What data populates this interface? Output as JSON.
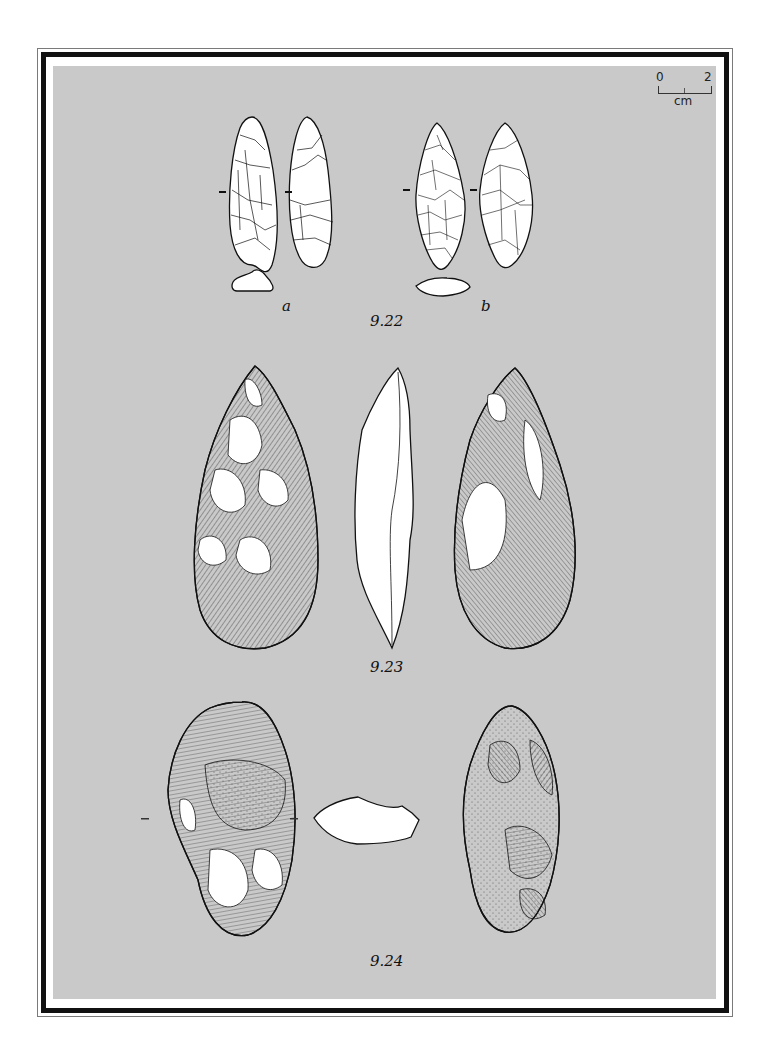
{
  "plate": {
    "background_color": "#c9c9c9",
    "border_color": "#111111"
  },
  "scale_bar": {
    "start_label": "0",
    "end_label": "2",
    "unit": "cm"
  },
  "figures": [
    {
      "number": "9.22",
      "sub_labels": [
        "a",
        "b"
      ],
      "description": "Two small bifacial leaf points, each shown in two faces with cross-section"
    },
    {
      "number": "9.23",
      "description": "Bifacial handaxe shown in front view, profile and back view"
    },
    {
      "number": "9.24",
      "description": "Bifacial tool shown in two faces with cross-section"
    }
  ]
}
